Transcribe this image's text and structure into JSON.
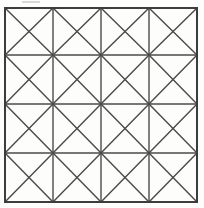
{
  "figure": {
    "type": "geometric-grid",
    "caption": ""
  },
  "canvas": {
    "width": 204,
    "height": 208,
    "background_color": "#fdfdfc"
  },
  "grid": {
    "rows": 4,
    "columns": 4,
    "cell_count": 16,
    "diagonals_per_cell": 2,
    "x_shapes": 16,
    "outer_border": true,
    "bounds": {
      "left": 5,
      "top": 8,
      "right": 197,
      "bottom": 202,
      "width": 192,
      "height": 194
    },
    "vertical_line_x": [
      5,
      53,
      101,
      149,
      197
    ],
    "horizontal_line_y": [
      8,
      55,
      104,
      153,
      202
    ],
    "line_color": "#4a4a4a",
    "border_color": "#3d3d3d",
    "line_width": 1.4,
    "border_width": 2.0
  },
  "artifacts": {
    "top_smudge": {
      "color": "#c9c9c6",
      "left": 22,
      "top": 1,
      "width": 18,
      "height": 2
    }
  }
}
